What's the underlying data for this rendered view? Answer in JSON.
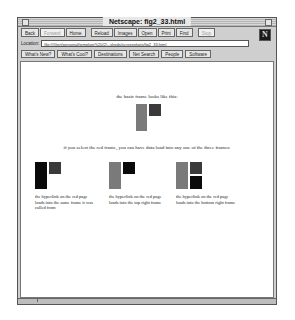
{
  "window": {
    "title": "Netscape: fig2_33.html"
  },
  "toolbar": {
    "buttons": [
      {
        "label": "Back",
        "enabled": true
      },
      {
        "label": "Forward",
        "enabled": false
      },
      {
        "label": "Home",
        "enabled": true
      },
      {
        "label": "Reload",
        "enabled": true
      },
      {
        "label": "Images",
        "enabled": true
      },
      {
        "label": "Open",
        "enabled": true
      },
      {
        "label": "Print",
        "enabled": true
      },
      {
        "label": "Find",
        "enabled": true
      },
      {
        "label": "Stop",
        "enabled": false
      }
    ],
    "logo": "N"
  },
  "location": {
    "label": "Location:",
    "value": "file:///Gert/personal/template%20(2)--sheds/screenshots/fig2_33.html"
  },
  "directory_buttons": [
    {
      "label": "What's New?"
    },
    {
      "label": "What's Cool?"
    },
    {
      "label": "Destinations"
    },
    {
      "label": "Net Search"
    },
    {
      "label": "People"
    },
    {
      "label": "Software"
    }
  ],
  "content": {
    "intro_text": "the basic frame looks like this:",
    "middle_text": "if you select the red frame, you can have data load into any one of the three frames:",
    "examples": [
      {
        "caption": "the hyperlink on the red page loads into the same frame it was called from"
      },
      {
        "caption": "the hyperlink on the red page loads into the top right frame"
      },
      {
        "caption": "the hyperlink on the red page loads into the bottom right frame"
      }
    ]
  },
  "colors": {
    "red_frame": "#7a7a7a",
    "dark_frame": "#3a3a3a",
    "black_frame": "#0a0a0a"
  }
}
